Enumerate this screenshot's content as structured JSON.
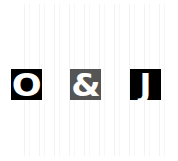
{
  "captcha": {
    "characters": [
      {
        "char": "O",
        "background": "#000000",
        "color": "#ffffff"
      },
      {
        "char": "&",
        "background": "#555555",
        "color": "#ffffff"
      },
      {
        "char": "J",
        "background": "#000000",
        "color": "#ffffff"
      }
    ],
    "text": "O&J",
    "background": "#ffffff",
    "noise": "faint vertical gray stripes"
  }
}
